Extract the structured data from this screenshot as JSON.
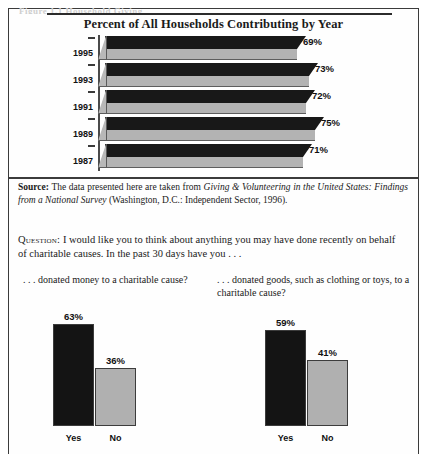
{
  "figure": {
    "caption_remnant": "Figure 1.1  Household Giving",
    "title": "Percent of All Households Contributing by Year"
  },
  "source": {
    "label": "Source:",
    "text_before": " The data presented here are taken from ",
    "italic_title": "Giving & Volunteering in the United States: Findings from a National Survey",
    "text_after": " (Washington, D.C.: Independent Sector, 1996)."
  },
  "question": {
    "label": "Question:",
    "text": " I would like you to think about anything you may have done recently on behalf of charitable causes. In the past 30 days have you . . ."
  },
  "subquestions": [
    {
      "prompt": ". . . donated money to a charitable cause?",
      "bars": [
        {
          "label": "Yes",
          "value": 63,
          "value_label": "63%",
          "style": "dark"
        },
        {
          "label": "No",
          "value": 36,
          "value_label": "36%",
          "style": "light"
        }
      ]
    },
    {
      "prompt": ". . . donated goods, such as clothing or toys, to a charitable cause?",
      "bars": [
        {
          "label": "Yes",
          "value": 59,
          "value_label": "59%",
          "style": "dark"
        },
        {
          "label": "No",
          "value": 41,
          "value_label": "41%",
          "style": "light"
        }
      ]
    }
  ],
  "chart_data": [
    {
      "type": "bar",
      "orientation": "horizontal",
      "title": "Percent of All Households Contributing by Year",
      "xlabel": "",
      "ylabel": "",
      "categories": [
        "1995",
        "1993",
        "1991",
        "1989",
        "1987"
      ],
      "values": [
        69,
        73,
        72,
        75,
        71
      ],
      "value_labels": [
        "69%",
        "73%",
        "72%",
        "75%",
        "71%"
      ],
      "xlim": [
        0,
        80
      ],
      "grid": false,
      "legend": "none",
      "style": "3d-horizontal-bars",
      "colors": {
        "bar_top": "#181818",
        "bar_front": "#b3b3b3",
        "bar_cap": "#b8b8b8"
      }
    },
    {
      "type": "bar",
      "orientation": "vertical",
      "title": ". . . donated money to a charitable cause?",
      "categories": [
        "Yes",
        "No"
      ],
      "values": [
        63,
        36
      ],
      "value_labels": [
        "63%",
        "36%"
      ],
      "ylim": [
        0,
        70
      ],
      "grid": false,
      "legend": "none",
      "colors": {
        "Yes": "#141414",
        "No": "#b0b0b0"
      }
    },
    {
      "type": "bar",
      "orientation": "vertical",
      "title": ". . . donated goods, such as clothing or toys, to a charitable cause?",
      "categories": [
        "Yes",
        "No"
      ],
      "values": [
        59,
        41
      ],
      "value_labels": [
        "59%",
        "41%"
      ],
      "ylim": [
        0,
        70
      ],
      "grid": false,
      "legend": "none",
      "colors": {
        "Yes": "#141414",
        "No": "#b0b0b0"
      }
    }
  ]
}
